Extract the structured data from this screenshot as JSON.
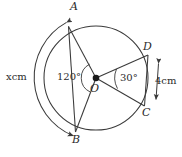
{
  "figure": {
    "stroke_color": "#3a3a3a",
    "text_color": "#2b2b2b",
    "background": "#ffffff",
    "center": {
      "label": "O",
      "x": 96,
      "y": 78
    },
    "circle": {
      "radius": 52,
      "cx": 96,
      "cy": 78
    },
    "outer_arc": {
      "radius": 63,
      "from_deg": 118,
      "to_deg": 249,
      "arrowheads": "both"
    },
    "points": [
      {
        "name": "A",
        "label": "A",
        "angle_deg": 118,
        "x": 71,
        "y": 32
      },
      {
        "name": "B",
        "label": "B",
        "angle_deg": 249,
        "x": 77,
        "y": 127
      },
      {
        "name": "C",
        "label": "C",
        "angle_deg": -29,
        "x": 141,
        "y": 103
      },
      {
        "name": "D",
        "label": "D",
        "angle_deg": 21,
        "x": 144,
        "y": 59
      }
    ],
    "angles": [
      {
        "name": "angle-AOB",
        "label": "120°",
        "value": 120,
        "unit": "degree"
      },
      {
        "name": "angle-DOC",
        "label": "30°",
        "value": 30,
        "unit": "degree"
      }
    ],
    "lengths": [
      {
        "name": "arc-AB-length",
        "label": "xcm",
        "value": "x",
        "unit": "cm"
      },
      {
        "name": "chord-DC-length",
        "label": "4cm",
        "value": "4",
        "unit": "cm"
      }
    ],
    "point_labels": {
      "a": "A",
      "b": "B",
      "c": "C",
      "d": "D",
      "o": "O"
    },
    "angle_labels": {
      "aob": "120°",
      "doc": "30°"
    },
    "length_labels": {
      "arc_ab": "xcm",
      "dc": "4cm"
    }
  }
}
